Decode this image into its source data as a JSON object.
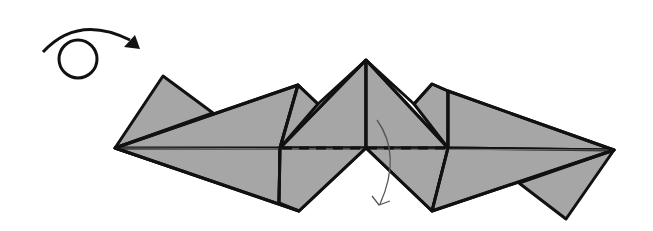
{
  "diagram": {
    "colors": {
      "paper": "#a6a6a6",
      "outline": "#111111",
      "crease": "#6e6e6e",
      "arrow": "#555555",
      "background": "#ffffff"
    },
    "symbols": [
      {
        "name": "turn-over-icon",
        "meaning": "turn the model over",
        "center": [
          78,
          55
        ]
      },
      {
        "name": "fold-arrow",
        "meaning": "fold top half down along dashed valley line"
      }
    ],
    "lines": {
      "valley_fold": {
        "style": "dashed",
        "from": [
          280,
          148
        ],
        "to": [
          448,
          148
        ]
      },
      "center_crease": {
        "style": "thin",
        "from": [
          115,
          148
        ],
        "to": [
          614,
          150
        ]
      }
    }
  }
}
